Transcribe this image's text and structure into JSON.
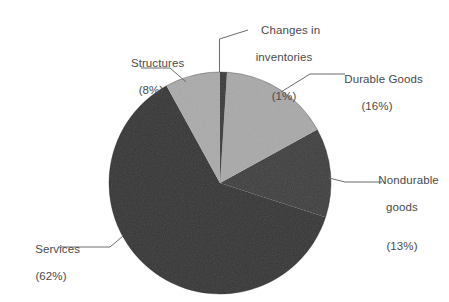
{
  "chart_data": {
    "type": "pie",
    "title": "",
    "subtitle": "",
    "xlabel": "",
    "ylabel": "",
    "legend_position": "none",
    "grid": false,
    "unit": "%",
    "start_angle_deg": 0,
    "direction": "clockwise",
    "categories": [
      "Changes in inventories",
      "Durable Goods",
      "Nondurable goods",
      "Services",
      "Structures"
    ],
    "values": [
      1,
      16,
      13,
      62,
      8
    ],
    "slices": [
      {
        "name": "Changes in inventories",
        "label_line1": "Changes in",
        "label_line2": "inventories",
        "percent": 1,
        "percent_text": "(1%)",
        "color": "#3a3a3a",
        "shade": "dark"
      },
      {
        "name": "Durable Goods",
        "label_line1": "Durable Goods",
        "label_line2": "",
        "percent": 16,
        "percent_text": "(16%)",
        "color": "#a9a9a9",
        "shade": "light"
      },
      {
        "name": "Nondurable goods",
        "label_line1": "Nondurable",
        "label_line2": "goods",
        "percent": 13,
        "percent_text": "(13%)",
        "color": "#3f3f3f",
        "shade": "dark"
      },
      {
        "name": "Services",
        "label_line1": "Services",
        "label_line2": "",
        "percent": 62,
        "percent_text": "(62%)",
        "color": "#363636",
        "shade": "dark"
      },
      {
        "name": "Structures",
        "label_line1": "Structures",
        "label_line2": "",
        "percent": 8,
        "percent_text": "(8%)",
        "color": "#ababab",
        "shade": "light"
      }
    ],
    "colors": {
      "light_gray": "#a9a9a9",
      "dark_gray": "#3a3a3a",
      "leader_line": "#6b6b6b",
      "label_text": "#4a4a4a",
      "background": "#ffffff"
    },
    "geometry": {
      "center_x": 220,
      "center_y": 183,
      "radius": 111
    }
  }
}
